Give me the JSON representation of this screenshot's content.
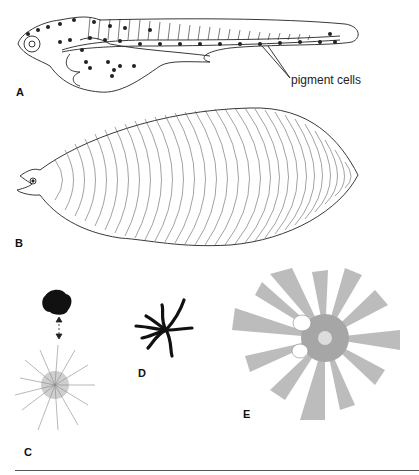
{
  "figure": {
    "panels": [
      {
        "id": "A",
        "label": "A",
        "description": "fish larva with pigment cells"
      },
      {
        "id": "B",
        "label": "B",
        "description": "leptocephalus larva"
      },
      {
        "id": "C",
        "label": "C",
        "description": "pigment cell contracted and expanded states"
      },
      {
        "id": "D",
        "label": "D",
        "description": "dendritic melanophore"
      },
      {
        "id": "E",
        "label": "E",
        "description": "radiating chromatophore"
      }
    ],
    "annotations": {
      "pigment_cells": "pigment cells"
    }
  }
}
